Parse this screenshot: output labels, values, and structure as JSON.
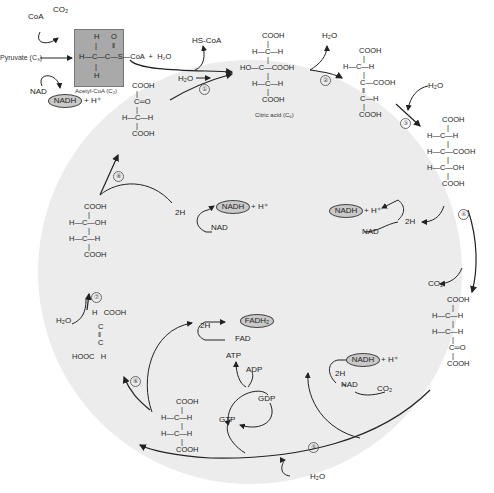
{
  "diagram": {
    "title_implied": "Krebs (citric acid) cycle",
    "background_circle_color": "#ececec",
    "acetyl_box_color": "#a9a9a9",
    "oval_fill": "#c9c9c9",
    "entry": {
      "pyruvate": "Pyruvate (C₃)",
      "coa_in": "CoA",
      "co2_out": "CO₂",
      "nad_in": "NAD",
      "nadh_out": "NADH",
      "h_plus": "+ H⁺",
      "acetyl_coa_label": "Acetyl-CoA (C₂)",
      "acetyl_struct": {
        "top": "H    O",
        "mid": "H—C—C—S—CoA  +  H₂O",
        "bottom": "H"
      },
      "hs_coa": "HS-CoA"
    },
    "steps": [
      "①",
      "②",
      "③",
      "④",
      "⑤",
      "⑥",
      "⑦",
      "⑧"
    ],
    "molecules": {
      "oxaloacetate": [
        "COOH",
        "C═O",
        "H—C—H",
        "COOH"
      ],
      "citric_acid": [
        "COOH",
        "H—C—H",
        "HO—C—COOH",
        "H—C—H",
        "COOH"
      ],
      "citric_acid_label": "Citric acid (C₆)",
      "cis_aconitate": [
        "COOH",
        "H—C—H",
        "C—COOH",
        "C—H",
        "COOH"
      ],
      "isocitrate": [
        "COOH",
        "H—C—H",
        "H—C—COOH",
        "H—C—OH",
        "COOH"
      ],
      "alpha_ketoglutarate": [
        "COOH",
        "H—C—H",
        "H—C—H",
        "C═O",
        "COOH"
      ],
      "succinate": [
        "COOH",
        "H—C—H",
        "H—C—H",
        "COOH"
      ],
      "fumarate": [
        "H   COOH",
        "C",
        "C",
        "HOOC   H"
      ],
      "malate": [
        "COOH",
        "H—C—OH",
        "H—C—H",
        "COOH"
      ]
    },
    "cofactors": {
      "h2o": "H₂O",
      "co2": "CO₂",
      "two_h": "2H",
      "nad": "NAD",
      "nadh": "NADH",
      "h_plus": "+ H⁺",
      "fad": "FAD",
      "fadh2": "FADH₂",
      "atp": "ATP",
      "adp": "ADP",
      "gtp": "GTP",
      "gdp": "GDP"
    }
  }
}
